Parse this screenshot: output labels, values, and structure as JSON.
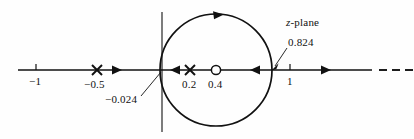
{
  "figure": {
    "plane_label": "z-plane",
    "plane_label_italic_part": "z",
    "plane_label_rest": "-plane",
    "background_color": "#fefefe",
    "stroke_color": "#111111"
  },
  "axis": {
    "name": "real-axis",
    "ticks": [
      {
        "label": "−1",
        "x": 36
      },
      {
        "label": "1",
        "x": 290
      }
    ],
    "origin_x": 162,
    "origin_y": 70,
    "dashed_tail": true
  },
  "poles": [
    {
      "label": "−0.5",
      "value": -0.5,
      "x": 97,
      "marker": "x"
    },
    {
      "label": "0.2",
      "value": 0.2,
      "x": 190,
      "marker": "x"
    }
  ],
  "zeros": [
    {
      "label": "0.4",
      "value": 0.4,
      "x": 216,
      "marker": "o"
    }
  ],
  "circle": {
    "name": "root-locus-circle",
    "center_x": 216,
    "center_y": 70,
    "radius": 56,
    "direction": "clockwise"
  },
  "annotations": [
    {
      "name": "breakaway-point-left",
      "label": "−0.024",
      "value": -0.024,
      "text_x": 110,
      "text_y": 99,
      "leader_from_x": 143,
      "leader_from_y": 96,
      "leader_to_x": 161,
      "leader_to_y": 73
    },
    {
      "name": "breakaway-point-right",
      "label": "0.824",
      "value": 0.824,
      "text_x": 288,
      "text_y": 42,
      "leader_from_x": 285,
      "leader_from_y": 50,
      "leader_to_x": 273,
      "leader_to_y": 68
    }
  ],
  "locus_arrows": [
    {
      "name": "arrow-left-segment",
      "x": 118,
      "y": 70,
      "dir": "right"
    },
    {
      "name": "arrow-inner-left",
      "x": 174,
      "y": 70,
      "dir": "left"
    },
    {
      "name": "arrow-inner-right",
      "x": 254,
      "y": 70,
      "dir": "left"
    },
    {
      "name": "arrow-right-segment",
      "x": 327,
      "y": 70,
      "dir": "right"
    },
    {
      "name": "arrow-circle-top",
      "x": 220,
      "y": 14,
      "dir": "clockwise"
    }
  ]
}
